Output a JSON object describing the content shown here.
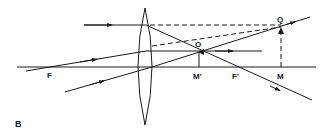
{
  "figure": {
    "panel_label": "B",
    "colors": {
      "ink": "#1a1a1a",
      "background": "#ffffff"
    },
    "labels": {
      "focal_point_left": "F",
      "focal_point_right": "F'",
      "object_base": "M'",
      "object_tip": "O",
      "image_base": "M",
      "image_tip": "Q"
    },
    "elements": {
      "lens": "biconvex-lens",
      "optical_axis": "principal-axis",
      "object_arrow": "object O M'",
      "image_arrow": "virtual image Q M (dashed)",
      "rays": [
        "ray parallel to axis refracted through F'",
        "ray through F refracted parallel to axis",
        "ray through optical centre undeviated"
      ]
    }
  }
}
